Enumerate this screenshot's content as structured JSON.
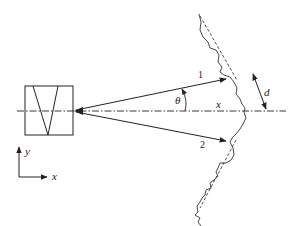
{
  "diagram": {
    "labels": {
      "ray_1": "1",
      "ray_2": "2",
      "angle": "θ",
      "distance_x": "x",
      "displacement_d": "d",
      "axis_x": "x",
      "axis_y": "y"
    },
    "elements": {
      "sensor": "camera/sensor box with V-shaped field-of-view symbol",
      "surface": "rough wall profile (solid) with mean plane (dashed)",
      "centerline": "dash-dot optical axis"
    },
    "colors": {
      "stroke": "#222222",
      "background": "#ffffff"
    }
  }
}
